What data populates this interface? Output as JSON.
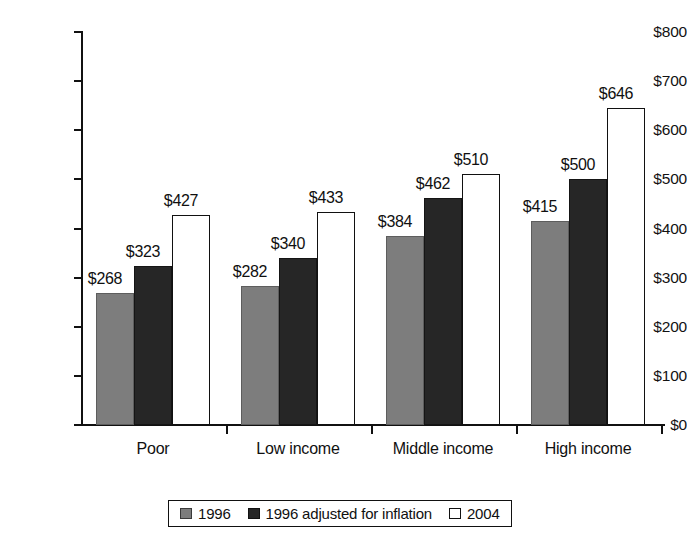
{
  "chart_data": {
    "type": "bar",
    "title": "",
    "subtitle": "",
    "xlabel": "",
    "ylabel": "",
    "ylim": [
      0,
      800
    ],
    "ytick_step": 100,
    "ytick_labels": [
      "$0",
      "$100",
      "$200",
      "$300",
      "$400",
      "$500",
      "$600",
      "$700",
      "$800"
    ],
    "ytick_values": [
      0,
      100,
      200,
      300,
      400,
      500,
      600,
      700,
      800
    ],
    "grid": false,
    "legend_position": "bottom-center",
    "value_label_prefix": "$",
    "categories": [
      "Poor",
      "Low income",
      "Middle income",
      "High income"
    ],
    "series": [
      {
        "name": "1996",
        "color": "#7d7d7d",
        "values": [
          268,
          323,
          384,
          415
        ],
        "labels": [
          "$268",
          "$384",
          "$384",
          "$415"
        ]
      },
      {
        "name": "1996 adjusted for inflation",
        "color": "#262626",
        "values": [
          323,
          340,
          462,
          500
        ],
        "labels": [
          "$323",
          "$340",
          "$462",
          "$500"
        ]
      },
      {
        "name": "2004",
        "color": "#ffffff",
        "values": [
          427,
          433,
          510,
          646
        ],
        "labels": [
          "$427",
          "$433",
          "$510",
          "$646"
        ]
      }
    ],
    "groups": [
      {
        "category": "Poor",
        "bars": [
          {
            "series": "1996",
            "value": 268,
            "label": "$268"
          },
          {
            "series": "1996 adjusted for inflation",
            "value": 323,
            "label": "$323"
          },
          {
            "series": "2004",
            "value": 427,
            "label": "$427"
          }
        ]
      },
      {
        "category": "Low income",
        "bars": [
          {
            "series": "1996",
            "value": 282,
            "label": "$282"
          },
          {
            "series": "1996 adjusted for inflation",
            "value": 340,
            "label": "$340"
          },
          {
            "series": "2004",
            "value": 433,
            "label": "$433"
          }
        ]
      },
      {
        "category": "Middle income",
        "bars": [
          {
            "series": "1996",
            "value": 384,
            "label": "$384"
          },
          {
            "series": "1996 adjusted for inflation",
            "value": 462,
            "label": "$462"
          },
          {
            "series": "2004",
            "value": 510,
            "label": "$510"
          }
        ]
      },
      {
        "category": "High income",
        "bars": [
          {
            "series": "1996",
            "value": 415,
            "label": "$415"
          },
          {
            "series": "1996 adjusted for inflation",
            "value": 500,
            "label": "$500"
          },
          {
            "series": "2004",
            "value": 646,
            "label": "$646"
          }
        ]
      }
    ]
  },
  "legend": {
    "items": [
      {
        "label": "1996",
        "swatch": "s0"
      },
      {
        "label": "1996 adjusted for inflation",
        "swatch": "s1"
      },
      {
        "label": "2004",
        "swatch": "s2"
      }
    ]
  },
  "colors": {
    "series_1996": "#7d7d7d",
    "series_1996_adjusted": "#262626",
    "series_2004": "#ffffff",
    "axis": "#111111",
    "text": "#101010",
    "background": "#ffffff"
  }
}
